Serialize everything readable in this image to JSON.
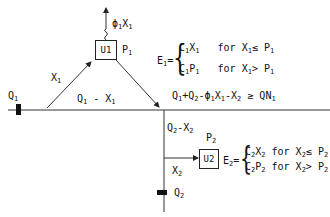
{
  "nodes": {
    "u1": {
      "label": "U1",
      "capacity_label": "P",
      "capacity_sub": "1"
    },
    "u2": {
      "label": "U2",
      "capacity_label": "P",
      "capacity_sub": "2"
    }
  },
  "sources": {
    "q1": {
      "label": "Q",
      "sub": "1"
    },
    "q2": {
      "label": "Q",
      "sub": "2"
    }
  },
  "flows": {
    "loss": {
      "text": "ϕ",
      "s1": "1",
      "t2": "X",
      "s2": "1"
    },
    "x1": {
      "text": "X",
      "sub": "1"
    },
    "q1_minus_x1": {
      "a": "Q",
      "as": "1",
      "op": " - X",
      "bs": "1"
    },
    "x2": {
      "text": "X",
      "sub": "2"
    },
    "q2_minus_x2": {
      "a": "Q",
      "as": "2",
      "op": "-X",
      "bs": "2"
    },
    "constraint": {
      "t1": "Q",
      "s1": "1",
      "t2": "+Q",
      "s2": "2",
      "t3": "-ϕ",
      "s3": "1",
      "t4": "X",
      "s4": "1",
      "t5": "-X",
      "s5": "2",
      "t6": " ≥ QN",
      "s6": "1"
    }
  },
  "equations": {
    "e1": {
      "lhs": "E",
      "lhs_sub": "1",
      "eq": "=",
      "case1": {
        "a": "C",
        "as": "1",
        "b": "X",
        "bs": "1",
        "cond": "for X",
        "cs": "1",
        "rel": "≤ P",
        "rs": "1"
      },
      "case2": {
        "a": "C",
        "as": "1",
        "b": "P",
        "bs": "1",
        "cond": "for X",
        "cs": "1",
        "rel": "> P",
        "rs": "1"
      }
    },
    "e2": {
      "lhs": "E",
      "lhs_sub": "2",
      "eq": "=",
      "case1": {
        "a": "C",
        "as": "2",
        "b": "X",
        "bs": "2",
        "cond": "for X",
        "cs": "2",
        "rel": "≤ P",
        "rs": "2"
      },
      "case2": {
        "a": "C",
        "as": "2",
        "b": "P",
        "bs": "2",
        "cond": "for X",
        "cs": "2",
        "rel": "> P",
        "rs": "2"
      }
    },
    "brace": "{"
  }
}
